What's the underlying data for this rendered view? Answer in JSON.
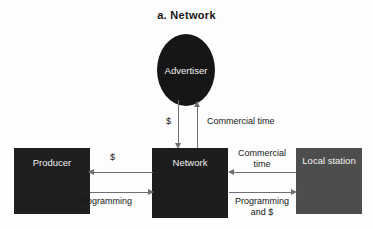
{
  "title": "a.  Network",
  "nodes": {
    "advertiser": {
      "label": "Advertiser",
      "shape": "circle",
      "fill": "#161616"
    },
    "producer": {
      "label": "Producer",
      "shape": "rect",
      "fill": "#1e1e1e"
    },
    "network": {
      "label": "Network",
      "shape": "rect",
      "fill": "#1d1d1d"
    },
    "local_station": {
      "label": "Local\nstation",
      "shape": "rect",
      "fill": "#4d4d4d"
    }
  },
  "edges": {
    "network_to_advertiser_money": {
      "label": "$",
      "from": "Network",
      "to": "Advertiser",
      "direction": "down"
    },
    "advertiser_to_network_time": {
      "label": "Commercial time",
      "from": "Advertiser",
      "to": "Network",
      "direction": "up"
    },
    "network_to_producer_money": {
      "label": "$",
      "from": "Network",
      "to": "Producer",
      "direction": "left"
    },
    "producer_to_network_programming": {
      "label": "Programming",
      "from": "Producer",
      "to": "Network",
      "direction": "right"
    },
    "local_to_network_time": {
      "label": "Commercial\ntime",
      "from": "Local station",
      "to": "Network",
      "direction": "left"
    },
    "network_to_local_programming": {
      "label": "Programming\nand $",
      "from": "Network",
      "to": "Local station",
      "direction": "right"
    }
  },
  "colors": {
    "background": "#fdfdfd",
    "edge": "#6f6f6f",
    "dark_fill": "#1d1d1d",
    "gray_fill": "#4d4d4d",
    "node_text": "#f2f2f2",
    "label_text": "#171717"
  }
}
